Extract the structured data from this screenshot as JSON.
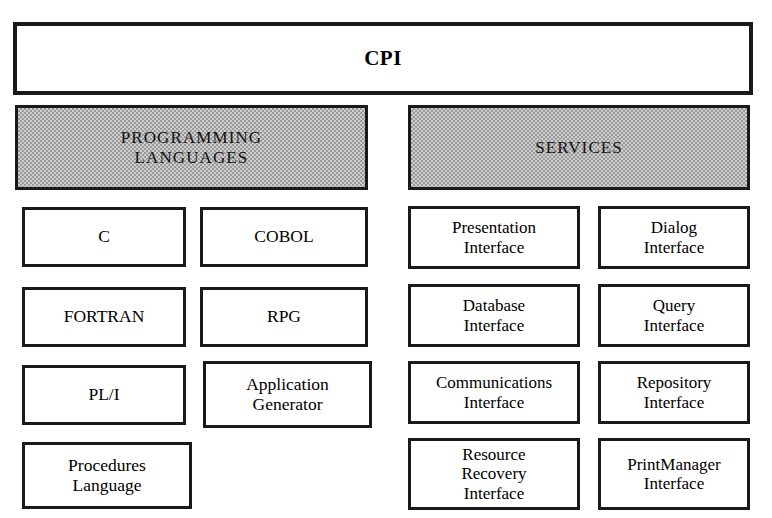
{
  "diagram": {
    "title": "CPI",
    "groups": [
      {
        "id": "programming-languages",
        "header": "PROGRAMMING\nLANGUAGES",
        "items": [
          {
            "id": "c",
            "label": "C"
          },
          {
            "id": "cobol",
            "label": "COBOL"
          },
          {
            "id": "fortran",
            "label": "FORTRAN"
          },
          {
            "id": "rpg",
            "label": "RPG"
          },
          {
            "id": "pl-i",
            "label": "PL/I"
          },
          {
            "id": "application-generator",
            "label": "Application\nGenerator"
          },
          {
            "id": "procedures-language",
            "label": "Procedures\nLanguage"
          }
        ]
      },
      {
        "id": "services",
        "header": "SERVICES",
        "items": [
          {
            "id": "presentation-interface",
            "label": "Presentation\nInterface"
          },
          {
            "id": "dialog-interface",
            "label": "Dialog\nInterface"
          },
          {
            "id": "database-interface",
            "label": "Database\nInterface"
          },
          {
            "id": "query-interface",
            "label": "Query\nInterface"
          },
          {
            "id": "communications-interface",
            "label": "Communications\nInterface"
          },
          {
            "id": "repository-interface",
            "label": "Repository\nInterface"
          },
          {
            "id": "resource-recovery-interface",
            "label": "Resource\nRecovery\nInterface"
          },
          {
            "id": "printmanager-interface",
            "label": "PrintManager\nInterface"
          }
        ]
      }
    ],
    "colors": {
      "border": "#1a1a1a",
      "header_fill": "#cdcdcd",
      "background": "#ffffff"
    }
  }
}
